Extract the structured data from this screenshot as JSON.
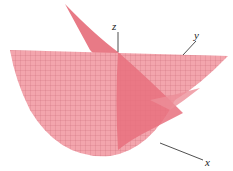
{
  "figure": {
    "type": "3d-surface-plot",
    "axes": {
      "x_label": "x",
      "y_label": "y",
      "z_label": "z"
    },
    "colors": {
      "surface": "#f3a0a8",
      "surface_dark": "#e8707e",
      "grid": "#b8505c",
      "axis": "#222222",
      "background": "#ffffff"
    }
  }
}
